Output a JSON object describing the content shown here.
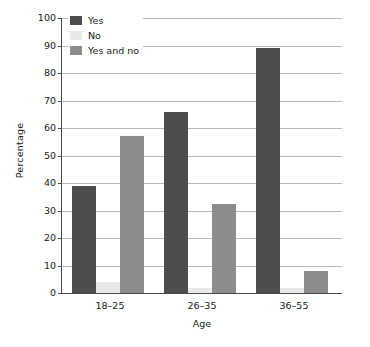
{
  "chart_data": {
    "type": "bar",
    "title": "",
    "xlabel": "Age",
    "ylabel": "Percentage",
    "categories": [
      "18–25",
      "26–35",
      "36–55"
    ],
    "series": [
      {
        "name": "Yes",
        "values": [
          39,
          66,
          89
        ],
        "color": "#4d4d4d"
      },
      {
        "name": "No",
        "values": [
          4,
          2,
          2
        ],
        "color": "#e8e8e8"
      },
      {
        "name": "Yes and no",
        "values": [
          57,
          32.5,
          8
        ],
        "color": "#8c8c8c"
      }
    ],
    "ylim": [
      0,
      100
    ],
    "ytick_step": 10,
    "yticks": [
      "0",
      "10",
      "20",
      "30",
      "40",
      "50",
      "60",
      "70",
      "80",
      "90",
      "100"
    ],
    "grid": "horizontal",
    "legend_position": "upper-left-inside",
    "axis_color": "#4a4a4a",
    "grid_color": "#b9b9b9"
  },
  "legend": {
    "items": [
      {
        "label": "Yes"
      },
      {
        "label": "No"
      },
      {
        "label": "Yes and no"
      }
    ]
  }
}
